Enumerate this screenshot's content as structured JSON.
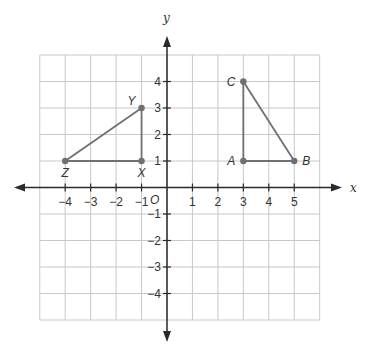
{
  "diagram": {
    "type": "coordinate-plane",
    "axes": {
      "x_label": "x",
      "y_label": "y",
      "origin_label": "O",
      "x_ticks": [
        {
          "value": -4,
          "label": "−4"
        },
        {
          "value": -3,
          "label": "−3"
        },
        {
          "value": -2,
          "label": "−2"
        },
        {
          "value": -1,
          "label": "−1"
        },
        {
          "value": 1,
          "label": "1"
        },
        {
          "value": 2,
          "label": "2"
        },
        {
          "value": 3,
          "label": "3"
        },
        {
          "value": 4,
          "label": "4"
        },
        {
          "value": 5,
          "label": "5"
        }
      ],
      "y_ticks": [
        {
          "value": 4,
          "label": "4"
        },
        {
          "value": 3,
          "label": "3"
        },
        {
          "value": 2,
          "label": "2"
        },
        {
          "value": 1,
          "label": "1"
        },
        {
          "value": -1,
          "label": "−1"
        },
        {
          "value": -2,
          "label": "−2"
        },
        {
          "value": -3,
          "label": "−3"
        },
        {
          "value": -4,
          "label": "−4"
        }
      ],
      "grid_x_range": [
        -5,
        6
      ],
      "grid_y_range": [
        -5,
        5
      ]
    },
    "triangles": [
      {
        "name": "XYZ",
        "points": [
          {
            "label": "X",
            "x": -1,
            "y": 1
          },
          {
            "label": "Y",
            "x": -1,
            "y": 3
          },
          {
            "label": "Z",
            "x": -4,
            "y": 1
          }
        ]
      },
      {
        "name": "ABC",
        "points": [
          {
            "label": "A",
            "x": 3,
            "y": 1
          },
          {
            "label": "B",
            "x": 5,
            "y": 1
          },
          {
            "label": "C",
            "x": 3,
            "y": 4
          }
        ]
      }
    ],
    "colors": {
      "grid": "#c8c8c8",
      "axis": "#2a2a2a",
      "triangle": "#707070",
      "text": "#333333"
    }
  }
}
